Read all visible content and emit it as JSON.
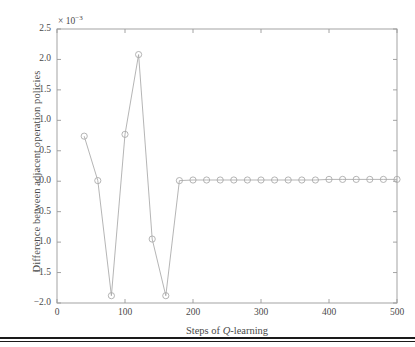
{
  "figure": {
    "axis_color": "#9a9a9a",
    "series_color": "#a8a8a8",
    "text_color": "#4a4a4a",
    "rule_color": "#1a1a1a",
    "exponent_prefix": "× 10",
    "exponent_power": "−3",
    "xlabel_prefix": "Steps of ",
    "xlabel_italic": "Q",
    "xlabel_suffix": "-learning",
    "ylabel": "Difference between adjacent operation policies"
  },
  "chart_data": {
    "type": "line",
    "title": "",
    "xlabel": "Steps of Q-learning",
    "ylabel": "Difference between adjacent operation policies",
    "y_exponent": -3,
    "y_exponent_label": "× 10⁻³",
    "xlim": [
      0,
      500
    ],
    "ylim": [
      -2.0,
      2.5
    ],
    "xticks": [
      0,
      100,
      200,
      300,
      400,
      500
    ],
    "xtick_labels": [
      "0",
      "100",
      "200",
      "300",
      "400",
      "500"
    ],
    "yticks": [
      -2.0,
      -1.5,
      -1.0,
      -0.5,
      0.0,
      0.5,
      1.0,
      1.5,
      2.0,
      2.5
    ],
    "ytick_labels": [
      "−2.0",
      "−1.5",
      "−1.0",
      "−0.5",
      "0.0",
      "0.5",
      "1.0",
      "1.5",
      "2.0",
      "2.5"
    ],
    "grid": false,
    "legend": false,
    "marker": "circle",
    "series": [
      {
        "name": "Difference between adjacent operation policies",
        "x": [
          40,
          60,
          80,
          100,
          120,
          140,
          160,
          180,
          200,
          220,
          240,
          260,
          280,
          300,
          320,
          340,
          360,
          380,
          400,
          420,
          440,
          460,
          480,
          500
        ],
        "values": [
          0.74,
          0.01,
          -1.88,
          0.77,
          2.08,
          -0.95,
          -1.88,
          0.01,
          0.02,
          0.02,
          0.02,
          0.02,
          0.02,
          0.02,
          0.02,
          0.02,
          0.02,
          0.02,
          0.03,
          0.03,
          0.03,
          0.03,
          0.03,
          0.03
        ]
      }
    ]
  }
}
